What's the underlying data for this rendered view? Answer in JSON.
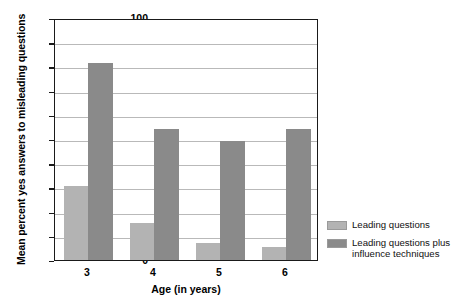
{
  "chart_data": {
    "type": "bar",
    "title": "",
    "xlabel": "Age (in years)",
    "ylabel": "Mean percent yes answers to misleading questions",
    "categories": [
      "3",
      "4",
      "5",
      "6"
    ],
    "series": [
      {
        "name": "Leading questions",
        "color": "#b3b3b3",
        "values": [
          30.5,
          15.5,
          7,
          5.5
        ]
      },
      {
        "name": "Leading questions plus influence techniques",
        "color": "#8a8a8a",
        "values": [
          81.5,
          54,
          49,
          54
        ]
      }
    ],
    "ylim": [
      0,
      100
    ],
    "yticks": [
      0,
      10,
      20,
      30,
      40,
      50,
      60,
      70,
      80,
      90,
      100
    ],
    "ytick_labels": [
      "0",
      "10",
      "20",
      "30",
      "40",
      "50",
      "60",
      "70",
      "80",
      "90",
      "100"
    ],
    "grid": true,
    "legend_position": "right-bottom"
  },
  "legend": {
    "entries": [
      {
        "label": "Leading questions"
      },
      {
        "label": "Leading questions plus influence techniques"
      }
    ]
  }
}
